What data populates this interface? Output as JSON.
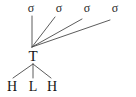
{
  "diagram": {
    "type": "chemical-bonding-diagram",
    "background_color": "#ffffff",
    "bond_color": "#4a4a4a",
    "text_color": "#141414",
    "center": {
      "label": "T",
      "x": 33,
      "y": 56
    },
    "sigma_bonds": [
      {
        "label": "σ",
        "x": 31,
        "y": 8,
        "line_end_x": 32,
        "line_end_y": 16
      },
      {
        "label": "σ",
        "x": 59,
        "y": 8,
        "line_end_x": 55,
        "line_end_y": 17
      },
      {
        "label": "σ",
        "x": 87,
        "y": 8,
        "line_end_x": 82,
        "line_end_y": 19
      },
      {
        "label": "σ",
        "x": 115,
        "y": 8,
        "line_end_x": 110,
        "line_end_y": 20
      }
    ],
    "ligands": [
      {
        "label": "H",
        "x": 12,
        "y": 87,
        "line_end_x": 13,
        "line_end_y": 78
      },
      {
        "label": "L",
        "x": 33,
        "y": 87,
        "line_end_x": 33,
        "line_end_y": 78
      },
      {
        "label": "H",
        "x": 52,
        "y": 87,
        "line_end_x": 51,
        "line_end_y": 78
      }
    ],
    "vertex": {
      "x": 32,
      "y": 47
    },
    "lower_origin": {
      "x": 33,
      "y": 64
    }
  }
}
